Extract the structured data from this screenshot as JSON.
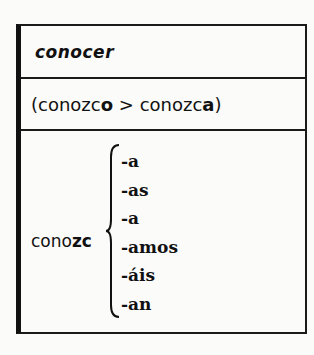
{
  "table": {
    "verb": "conocer",
    "change": {
      "open": "(",
      "from_stem": "conozc",
      "from_end": "o",
      "arrow": " > ",
      "to_stem": "conozc",
      "to_end": "a",
      "close": ")"
    },
    "stem_plain": "cono",
    "stem_bold": "zc",
    "endings": [
      "-a",
      "-as",
      "-a",
      "-amos",
      "-áis",
      "-an"
    ]
  }
}
